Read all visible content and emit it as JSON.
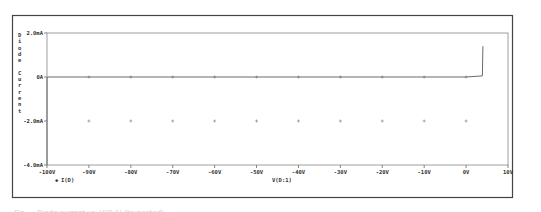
{
  "chart_data": {
    "type": "line",
    "title": "",
    "xlabel": "V(D:1)",
    "ylabel": "Diode current",
    "legend": [
      "I(D)"
    ],
    "legend_position": "below-left of x-axis",
    "grid": "cross markers",
    "xlim": [
      -100,
      10
    ],
    "ylim": [
      -4.0,
      2.0
    ],
    "x_unit": "V",
    "y_unit": "mA",
    "x_ticks": [
      "-100V",
      "-90V",
      "-80V",
      "-70V",
      "-60V",
      "-50V",
      "-40V",
      "-30V",
      "-20V",
      "-10V",
      "0V",
      "10V"
    ],
    "x_tick_values": [
      -100,
      -90,
      -80,
      -70,
      -60,
      -50,
      -40,
      -30,
      -20,
      -10,
      0,
      10
    ],
    "y_ticks": [
      "2.0mA",
      "0A",
      "-2.0mA",
      "-4.0mA"
    ],
    "y_tick_values": [
      2.0,
      0.0,
      -2.0,
      -4.0
    ],
    "series": [
      {
        "name": "I(D)",
        "x": [
          -100,
          -100,
          -99.9,
          -50,
          0,
          3.9,
          4.0
        ],
        "y": [
          -4.0,
          -0.05,
          0.0,
          0.0,
          0.0,
          0.05,
          1.4
        ]
      }
    ]
  },
  "plot": {
    "y_axis_title_chars": [
      "D",
      "i",
      "o",
      "d",
      "e",
      "",
      "C",
      "u",
      "r",
      "r",
      "e",
      "n",
      "t"
    ],
    "legend_marker": "◆",
    "legend_label": "I(D)",
    "x_axis_title": "V(D:1)"
  },
  "caption": "Fig. ... Diode current vs. V(D:1) (truncated)"
}
